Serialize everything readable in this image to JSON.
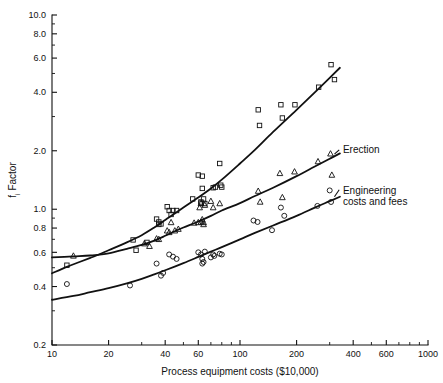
{
  "chart_data": {
    "type": "scatter",
    "title": "",
    "xlabel": "Process equipment costs ($10,000)",
    "ylabel": "f, Factor",
    "ylabel_base": "f",
    "ylabel_sub": "i",
    "ylabel_rest": " Factor",
    "xscale": "log",
    "yscale": "log",
    "xlim": [
      10,
      1000
    ],
    "ylim": [
      0.2,
      10.0
    ],
    "grid": false,
    "legend_position": "inline-right",
    "xticks": [
      10,
      20,
      40,
      60,
      100,
      200,
      400,
      600,
      1000
    ],
    "xticklabels": [
      "10",
      "20",
      "40",
      "60",
      "100",
      "200",
      "400",
      "600",
      "1000"
    ],
    "xminorticks": [
      30,
      50,
      70,
      80,
      90,
      300,
      500,
      700,
      800,
      900
    ],
    "yticks": [
      0.2,
      0.4,
      0.6,
      0.8,
      1.0,
      2.0,
      4.0,
      6.0,
      8.0,
      10.0
    ],
    "yticklabels": [
      "0.2",
      "0.4",
      "0.6",
      "0.8",
      "1.0",
      "2.0",
      "4.0",
      "6.0",
      "8.0",
      "10.0"
    ],
    "yminorticks": [
      0.3,
      0.5,
      0.7,
      0.9,
      3.0,
      5.0,
      7.0,
      9.0
    ],
    "series": [
      {
        "name": "Direct materials",
        "marker": "square",
        "label": "Direct materials",
        "label_x": 340,
        "label_y": 940,
        "leader_from": [
          322,
          880
        ],
        "leader_to": [
          337,
          935
        ],
        "curve": [
          [
            10,
            0.468
          ],
          [
            12,
            0.505
          ],
          [
            14,
            0.535
          ],
          [
            16,
            0.562
          ],
          [
            18,
            0.588
          ],
          [
            20,
            0.615
          ],
          [
            25,
            0.675
          ],
          [
            30,
            0.735
          ],
          [
            35,
            0.805
          ],
          [
            40,
            0.88
          ],
          [
            45,
            0.95
          ],
          [
            50,
            1.02
          ],
          [
            60,
            1.15
          ],
          [
            70,
            1.28
          ],
          [
            80,
            1.42
          ],
          [
            100,
            1.72
          ],
          [
            120,
            2.02
          ],
          [
            150,
            2.5
          ],
          [
            200,
            3.25
          ],
          [
            250,
            4.0
          ],
          [
            300,
            4.75
          ],
          [
            340,
            5.35
          ]
        ],
        "points": [
          [
            12,
            0.515
          ],
          [
            27,
            0.695
          ],
          [
            28,
            0.615
          ],
          [
            32,
            0.675
          ],
          [
            36,
            0.89
          ],
          [
            37,
            0.86
          ],
          [
            37,
            0.835
          ],
          [
            38,
            0.84
          ],
          [
            41,
            1.03
          ],
          [
            42,
            0.985
          ],
          [
            43,
            0.94
          ],
          [
            44,
            0.985
          ],
          [
            46,
            0.985
          ],
          [
            56,
            1.13
          ],
          [
            60,
            1.5
          ],
          [
            62,
            1.09
          ],
          [
            62,
            1.075
          ],
          [
            63,
            1.48
          ],
          [
            63,
            1.28
          ],
          [
            64,
            1.13
          ],
          [
            65,
            1.07
          ],
          [
            72,
            1.29
          ],
          [
            74,
            1.3
          ],
          [
            78,
            1.72
          ],
          [
            79,
            1.33
          ],
          [
            80,
            1.3
          ],
          [
            125,
            3.25
          ],
          [
            127,
            2.7
          ],
          [
            165,
            3.45
          ],
          [
            168,
            2.95
          ],
          [
            196,
            3.45
          ],
          [
            262,
            4.25
          ],
          [
            305,
            5.55
          ],
          [
            318,
            4.65
          ]
        ]
      },
      {
        "name": "Erection",
        "marker": "triangle",
        "label": "Erection",
        "label_x": 340,
        "label_y": 2.02,
        "leader_from": [
          318,
          1.92
        ],
        "leader_to": [
          337,
          2.02
        ],
        "curve": [
          [
            10,
            0.565
          ],
          [
            13,
            0.572
          ],
          [
            16,
            0.578
          ],
          [
            20,
            0.592
          ],
          [
            25,
            0.625
          ],
          [
            30,
            0.655
          ],
          [
            35,
            0.69
          ],
          [
            40,
            0.73
          ],
          [
            45,
            0.77
          ],
          [
            50,
            0.805
          ],
          [
            60,
            0.865
          ],
          [
            70,
            0.925
          ],
          [
            80,
            0.985
          ],
          [
            100,
            1.075
          ],
          [
            120,
            1.17
          ],
          [
            150,
            1.29
          ],
          [
            200,
            1.48
          ],
          [
            250,
            1.66
          ],
          [
            300,
            1.82
          ],
          [
            340,
            1.94
          ]
        ],
        "points": [
          [
            13,
            0.575
          ],
          [
            31,
            0.665
          ],
          [
            33,
            0.645
          ],
          [
            36,
            0.705
          ],
          [
            37,
            0.7
          ],
          [
            41,
            0.775
          ],
          [
            42,
            0.76
          ],
          [
            43,
            0.855
          ],
          [
            45,
            0.775
          ],
          [
            47,
            0.79
          ],
          [
            57,
            0.85
          ],
          [
            60,
            0.855
          ],
          [
            61,
            1.02
          ],
          [
            62,
            0.86
          ],
          [
            62,
            1.07
          ],
          [
            63,
            0.885
          ],
          [
            64,
            0.855
          ],
          [
            64,
            0.835
          ],
          [
            65,
            1.05
          ],
          [
            70,
            1.1
          ],
          [
            72,
            1.02
          ],
          [
            78,
            1.07
          ],
          [
            125,
            1.24
          ],
          [
            128,
            1.09
          ],
          [
            163,
            1.53
          ],
          [
            168,
            1.15
          ],
          [
            195,
            1.56
          ],
          [
            260,
            1.76
          ],
          [
            303,
            1.93
          ],
          [
            308,
            1.5
          ]
        ]
      },
      {
        "name": "Engineering costs and fees",
        "marker": "circle",
        "label_line1": "Engineering",
        "label_line2": "costs and fees",
        "label_x": 340,
        "label_y": 1.24,
        "leader_from": [
          318,
          1.16
        ],
        "leader_to": [
          337,
          1.26
        ],
        "curve": [
          [
            10,
            0.342
          ],
          [
            13,
            0.358
          ],
          [
            16,
            0.374
          ],
          [
            20,
            0.392
          ],
          [
            25,
            0.415
          ],
          [
            30,
            0.438
          ],
          [
            35,
            0.462
          ],
          [
            40,
            0.485
          ],
          [
            50,
            0.528
          ],
          [
            60,
            0.568
          ],
          [
            70,
            0.605
          ],
          [
            80,
            0.638
          ],
          [
            100,
            0.7
          ],
          [
            120,
            0.755
          ],
          [
            150,
            0.825
          ],
          [
            200,
            0.925
          ],
          [
            250,
            1.02
          ],
          [
            300,
            1.1
          ],
          [
            340,
            1.16
          ]
        ],
        "points": [
          [
            12,
            0.412
          ],
          [
            26,
            0.405
          ],
          [
            36,
            0.525
          ],
          [
            38,
            0.455
          ],
          [
            39,
            0.47
          ],
          [
            42,
            0.585
          ],
          [
            44,
            0.57
          ],
          [
            46,
            0.555
          ],
          [
            60,
            0.6
          ],
          [
            62,
            0.585
          ],
          [
            63,
            0.555
          ],
          [
            63,
            0.525
          ],
          [
            64,
            0.535
          ],
          [
            65,
            0.605
          ],
          [
            70,
            0.565
          ],
          [
            72,
            0.585
          ],
          [
            73,
            0.575
          ],
          [
            78,
            0.59
          ],
          [
            80,
            0.585
          ],
          [
            118,
            0.875
          ],
          [
            124,
            0.86
          ],
          [
            148,
            0.78
          ],
          [
            165,
            1.02
          ],
          [
            172,
            0.925
          ],
          [
            258,
            1.04
          ],
          [
            300,
            1.25
          ],
          [
            305,
            1.09
          ]
        ]
      }
    ]
  }
}
